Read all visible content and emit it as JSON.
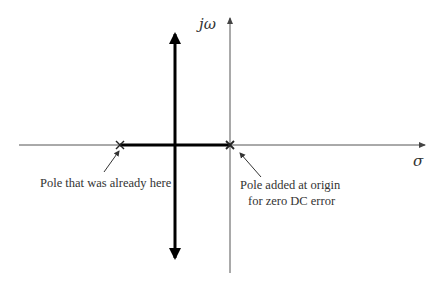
{
  "diagram": {
    "type": "s-plane root locus sketch",
    "axes": {
      "vertical_label": "jω",
      "horizontal_label": "σ"
    },
    "poles": [
      {
        "name": "existing-pole",
        "marker": "×",
        "annotation": "Pole that was already here"
      },
      {
        "name": "origin-pole",
        "marker": "×",
        "annotation_line1": "Pole added at origin",
        "annotation_line2": "for zero DC error"
      }
    ],
    "locus": {
      "segment": "real axis between the two poles",
      "branches": "vertical asymptote branches going up and down from breakaway point"
    },
    "colors": {
      "axis": "#555555",
      "locus": "#000000",
      "text": "#333333"
    }
  }
}
